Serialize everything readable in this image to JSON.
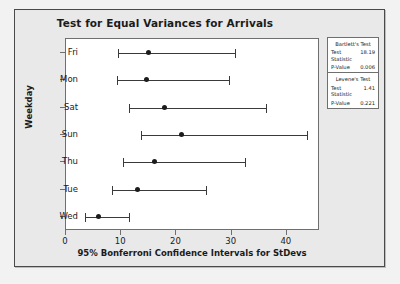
{
  "chart_data": {
    "type": "scatter",
    "title": "Test for Equal Variances for Arrivals",
    "xlabel": "95% Bonferroni Confidence Intervals for StDevs",
    "ylabel": "Weekday",
    "xlim": [
      0,
      46
    ],
    "xticks": [
      0,
      10,
      20,
      30,
      40
    ],
    "xtick_labels": [
      "0",
      "10",
      "20",
      "30",
      "40"
    ],
    "categories": [
      "Fri",
      "Mon",
      "Sat",
      "Sun",
      "Thu",
      "Tue",
      "Wed"
    ],
    "grid": false,
    "legend": "none",
    "intervals": [
      {
        "category": "Fri",
        "lower": 9.4,
        "estimate": 14.9,
        "upper": 30.6
      },
      {
        "category": "Mon",
        "lower": 9.2,
        "estimate": 14.5,
        "upper": 29.6
      },
      {
        "category": "Sat",
        "lower": 11.4,
        "estimate": 17.8,
        "upper": 36.3
      },
      {
        "category": "Sun",
        "lower": 13.5,
        "estimate": 21.0,
        "upper": 43.7
      },
      {
        "category": "Thu",
        "lower": 10.3,
        "estimate": 16.0,
        "upper": 32.4
      },
      {
        "category": "Tue",
        "lower": 8.4,
        "estimate": 12.9,
        "upper": 25.3
      },
      {
        "category": "Wed",
        "lower": 3.5,
        "estimate": 5.9,
        "upper": 11.4
      }
    ]
  },
  "stats": {
    "bartlett": {
      "heading": "Bartlett's Test",
      "statistic_label": "Test Statistic",
      "statistic_value": "18.19",
      "pvalue_label": "P-Value",
      "pvalue_value": "0.006"
    },
    "levene": {
      "heading": "Levene's Test",
      "statistic_label": "Test Statistic",
      "statistic_value": "1.41",
      "pvalue_label": "P-Value",
      "pvalue_value": "0.221"
    }
  },
  "colors": {
    "figure_background": "#e9e9e9",
    "plot_background": "#ffffff",
    "axis": "#6f6f6f",
    "marker": "#1c1c1c",
    "text": "#1b1b1b"
  }
}
